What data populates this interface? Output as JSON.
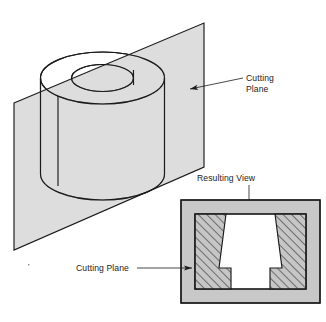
{
  "figure": {
    "colors": {
      "plane_fill": "#c8c8c8",
      "solid_fill": "#c6c6c6",
      "frame_fill": "#c8c8c8",
      "hatch_fill": "#c6c6c6",
      "void_fill": "#ffffff",
      "line": "#1a1a1a",
      "page_background": "#ffffff"
    }
  },
  "labels": {
    "cutting_plane_top": {
      "line1": "Cutting",
      "line2": "Plane"
    },
    "resulting_view": "Resulting View",
    "cutting_plane_bottom": "Cutting Plane"
  },
  "pictorial": {
    "name": "isometric-cylinder-with-cutting-plane",
    "cutting_plane_polygon": "14,103 204,23 204,167 14,250",
    "cylinder": {
      "top_ellipse_center": [
        102.5,
        78
      ],
      "top_ellipse_rx": 62,
      "top_ellipse_ry": 26,
      "bore_ellipse_center": [
        102.5,
        78
      ],
      "bore_ellipse_rx": 31,
      "bore_ellipse_ry": 13.5,
      "height": 96
    }
  },
  "section_view": {
    "name": "resulting-sectional-view",
    "outer_rect": [
      181,
      200,
      139,
      103
    ],
    "inner_rect": [
      195,
      214,
      111,
      75
    ],
    "hatch_angle_degrees": 45,
    "hatch_spacing_px": 6
  }
}
